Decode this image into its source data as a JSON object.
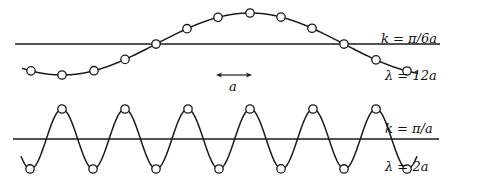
{
  "diagram": {
    "colors": {
      "stroke": "#1a1a1a",
      "background": "#ffffff"
    },
    "top_panel": {
      "k_label": "k = π/6a",
      "lambda_label": "λ = 12a",
      "baseline_y": 44,
      "baseline_x": [
        15,
        440
      ],
      "amplitude_px": 31,
      "atom_positions_x": [
        31,
        62,
        94,
        125,
        156,
        187,
        218,
        250,
        281,
        312,
        344,
        376,
        407
      ]
    },
    "spacing_arrow": {
      "label": "a",
      "x": [
        216,
        252
      ],
      "y": 75
    },
    "bottom_panel": {
      "k_label": "k = π/a",
      "lambda_label": "λ = 2a",
      "baseline_y": 139,
      "baseline_x": [
        13,
        439
      ],
      "amplitude_px": 30,
      "atom_positions_x": [
        30,
        62,
        93,
        125,
        156,
        188,
        219,
        250,
        281,
        313,
        344,
        376,
        407
      ]
    }
  }
}
